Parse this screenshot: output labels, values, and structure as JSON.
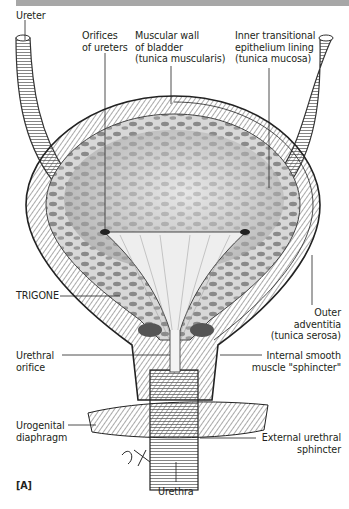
{
  "figure": {
    "panel_label": "[A]",
    "signature": "S.H.",
    "header_bar_color": "#a7a7a7"
  },
  "labels": {
    "ureter": "Ureter",
    "orifices_ureters": "Orifices\nof ureters",
    "muscular_wall": "Muscular wall\nof bladder\n(tunica muscularis)",
    "inner_lining": "Inner transitional\nepithelium lining\n(tunica mucosa)",
    "trigone": "TRIGONE",
    "outer_adventitia": "Outer\nadventitia\n(tunica serosa)",
    "urethral_orifice": "Urethral\norifice",
    "internal_sphincter": "Internal smooth\nmuscle \"sphincter\"",
    "urogenital_diaphragm": "Urogenital\ndiaphragm",
    "external_sphincter": "External urethral\nsphincter",
    "urethra": "Urethra"
  }
}
